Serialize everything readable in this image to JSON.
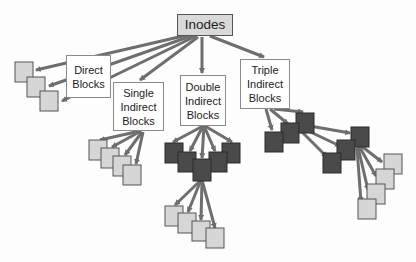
{
  "diagram": {
    "type": "inode block pointer hierarchy",
    "root": {
      "label": "Inodes"
    },
    "branches": [
      {
        "label": "Direct\nBlocks",
        "leaf_blocks": 3
      },
      {
        "label": "Single\nIndirect\nBlocks",
        "leaf_blocks": 4
      },
      {
        "label": "Double\nIndirect\nBlocks",
        "indirect_blocks_level1": 5,
        "leaf_blocks": 4
      },
      {
        "label": "Triple\nIndirect\nBlocks",
        "indirect_blocks_level1": 3,
        "indirect_blocks_level2": 3,
        "leaf_blocks": 4
      }
    ],
    "colors": {
      "arrow": "#6e6e6e",
      "data_block_fill": "#d6d6d6",
      "data_block_border": "#555555",
      "indirect_block_fill": "#4a4a4a",
      "indirect_block_border": "#2a2a2a",
      "inodes_fill": "#d9d9d9",
      "label_fill": "#ffffff"
    }
  }
}
